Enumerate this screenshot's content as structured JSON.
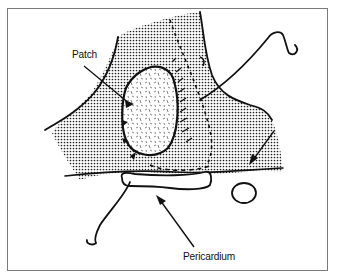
{
  "figure": {
    "type": "anatomical line drawing",
    "frame_color": "#7a7a7a",
    "ink_color": "#111111",
    "labels": {
      "patch": "Patch",
      "pericardium": "Pericardium"
    },
    "structures": [
      {
        "name": "patch",
        "fill": "dashed-hatch"
      },
      {
        "name": "vessel-region",
        "fill": "stippled-dots"
      },
      {
        "name": "pericardium-strip",
        "fill": "none"
      },
      {
        "name": "small-vessel-ring",
        "fill": "none"
      }
    ],
    "arrows": [
      {
        "name": "patch-leader",
        "target": "patch"
      },
      {
        "name": "pericardium-arrow",
        "target": "pericardium"
      },
      {
        "name": "right-arrow",
        "target": "region-edge"
      }
    ]
  }
}
